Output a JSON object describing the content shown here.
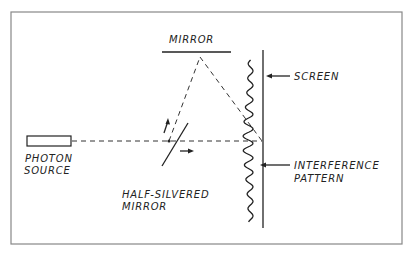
{
  "diagram": {
    "labels": {
      "mirror": "MIRROR",
      "screen": "SCREEN",
      "photon_source_line1": "PHOTON",
      "photon_source_line2": "SOURCE",
      "half_silvered_line1": "HALF-SILVERED",
      "half_silvered_line2": "MIRROR",
      "interference_line1": "INTERFERENCE",
      "interference_line2": "PATTERN"
    },
    "components": [
      "photon-source",
      "half-silvered-mirror",
      "mirror",
      "screen",
      "interference-pattern"
    ],
    "colors": {
      "ink": "#222222",
      "frame": "#888888",
      "background": "#ffffff"
    }
  }
}
